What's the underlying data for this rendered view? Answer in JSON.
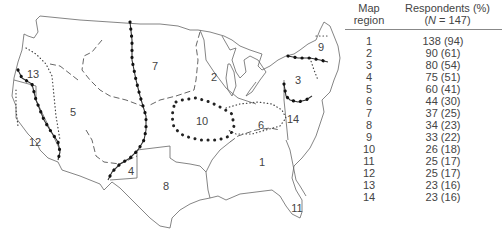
{
  "map": {
    "regions": [
      {
        "id": "1",
        "x": 262,
        "y": 163
      },
      {
        "id": "2",
        "x": 214,
        "y": 78
      },
      {
        "id": "3",
        "x": 298,
        "y": 81
      },
      {
        "id": "4",
        "x": 131,
        "y": 172
      },
      {
        "id": "5",
        "x": 73,
        "y": 113
      },
      {
        "id": "6",
        "x": 261,
        "y": 126
      },
      {
        "id": "7",
        "x": 155,
        "y": 67
      },
      {
        "id": "8",
        "x": 166,
        "y": 187
      },
      {
        "id": "9",
        "x": 321,
        "y": 48
      },
      {
        "id": "10",
        "x": 202,
        "y": 122
      },
      {
        "id": "11",
        "x": 297,
        "y": 209
      },
      {
        "id": "12",
        "x": 35,
        "y": 143
      },
      {
        "id": "13",
        "x": 33,
        "y": 75
      },
      {
        "id": "14",
        "x": 293,
        "y": 120
      }
    ]
  },
  "table": {
    "header": {
      "col1_line1": "Map",
      "col1_line2": "region",
      "col2_line1": "Respondents (%)",
      "col2_line2_prefix": "(",
      "col2_line2_n": "N",
      "col2_line2_suffix": " = 147)"
    },
    "rows": [
      {
        "region": "1",
        "respondents": "138 (94)"
      },
      {
        "region": "2",
        "respondents": "90 (61)"
      },
      {
        "region": "3",
        "respondents": "80 (54)"
      },
      {
        "region": "4",
        "respondents": "75 (51)"
      },
      {
        "region": "5",
        "respondents": "60 (41)"
      },
      {
        "region": "6",
        "respondents": "44 (30)"
      },
      {
        "region": "7",
        "respondents": "37 (25)"
      },
      {
        "region": "8",
        "respondents": "34 (23)"
      },
      {
        "region": "9",
        "respondents": "33 (22)"
      },
      {
        "region": "10",
        "respondents": "26 (18)"
      },
      {
        "region": "11",
        "respondents": "25 (17)"
      },
      {
        "region": "12",
        "respondents": "25 (17)"
      },
      {
        "region": "13",
        "respondents": "23 (16)"
      },
      {
        "region": "14",
        "respondents": "23 (16)"
      }
    ]
  }
}
